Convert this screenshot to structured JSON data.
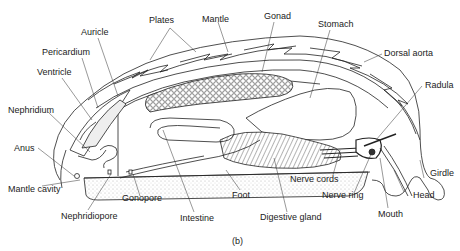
{
  "figure": {
    "caption": "(b)"
  },
  "labels": {
    "plates": "Plates",
    "mantle": "Mantle",
    "gonad": "Gonad",
    "stomach": "Stomach",
    "auricle": "Auricle",
    "pericardium": "Pericardium",
    "ventricle": "Ventricle",
    "dorsal_aorta": "Dorsal aorta",
    "nephridium": "Nephridium",
    "radula": "Radula",
    "anus": "Anus",
    "girdle": "Girdle",
    "mantle_cavity": "Mantle cavity",
    "nerve_cords": "Nerve cords",
    "nerve_ring": "Nerve ring",
    "head": "Head",
    "gonopore": "Gonopore",
    "foot": "Foot",
    "nephridiopore": "Nephridiopore",
    "intestine": "Intestine",
    "digestive_gland": "Digestive gland",
    "mouth": "Mouth"
  },
  "colors": {
    "line": "#222222",
    "stipple": "#d8d8d8",
    "background": "#ffffff"
  }
}
